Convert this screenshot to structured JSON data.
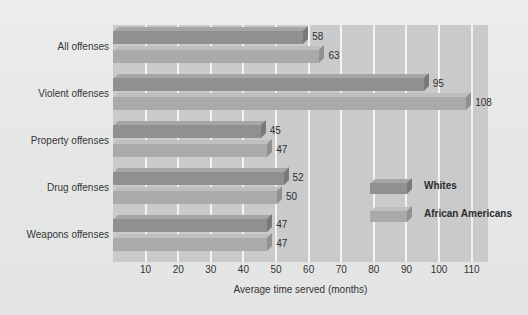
{
  "chart_data": {
    "type": "bar",
    "orientation": "horizontal",
    "title": "",
    "xlabel": "Average time served (months)",
    "ylabel": "",
    "categories": [
      "All offenses",
      "Violent offenses",
      "Property offenses",
      "Drug offenses",
      "Weapons offenses"
    ],
    "series": [
      {
        "name": "Whites",
        "values": [
          58,
          95,
          45,
          52,
          47
        ],
        "color": "#8e9092"
      },
      {
        "name": "African Americans",
        "values": [
          63,
          108,
          47,
          50,
          47
        ],
        "color": "#a8aaac"
      }
    ],
    "xlim": [
      0,
      115
    ],
    "xticks": [
      10,
      20,
      30,
      40,
      50,
      60,
      70,
      80,
      90,
      100,
      110
    ],
    "xticklabels": [
      "10",
      "20",
      "30",
      "40",
      "50",
      "60",
      "70",
      "80",
      "90",
      "100",
      "110"
    ],
    "grid": "vertical-only",
    "gridline_color": "#f2f3f3",
    "legend_position": "inside-right-middle",
    "plot_background": "#c9cacb",
    "page_background": "#e8e8e8",
    "data_labels": [
      "58",
      "63",
      "95",
      "108",
      "45",
      "47",
      "52",
      "50",
      "47",
      "47"
    ],
    "style": "3d-beveled-bars-grayscale"
  },
  "legend": {
    "items": [
      {
        "label": "Whites"
      },
      {
        "label": "African Americans"
      }
    ]
  },
  "axis": {
    "x_title": "Average time served (months)"
  }
}
